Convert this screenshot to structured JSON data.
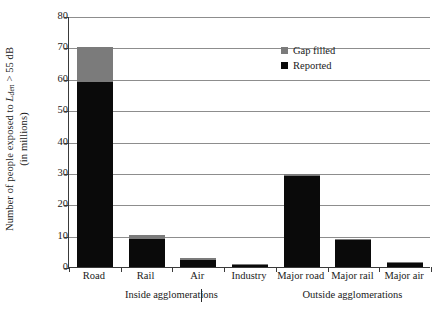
{
  "chart_data": {
    "type": "bar",
    "title": "",
    "xlabel": "",
    "ylabel_line1_prefix": "Number of people exposed to ",
    "ylabel_symbol": "L",
    "ylabel_subscript": "den",
    "ylabel_line1_suffix": " > 55 dB",
    "ylabel_line2": "(in millions)",
    "ylim": [
      0,
      80
    ],
    "ytick_values": [
      0,
      10,
      20,
      30,
      40,
      50,
      60,
      70,
      80
    ],
    "ytick_labels": [
      "0",
      "10",
      "20",
      "30",
      "40",
      "50",
      "60",
      "70",
      "80"
    ],
    "grid": true,
    "grid_axis": "y",
    "legend_position": "upper-right-inside",
    "stacked": true,
    "categories": [
      "Road",
      "Rail",
      "Air",
      "Industry",
      "Major road",
      "Major rail",
      "Major air"
    ],
    "series": [
      {
        "name": "Reported",
        "color": "#0a0a0a",
        "values": [
          59,
          9,
          2.2,
          0.9,
          29,
          8.8,
          1.3
        ]
      },
      {
        "name": "Gap filled",
        "color": "#7b7b7b",
        "values": [
          11,
          1.1,
          0.6,
          0.1,
          0.7,
          0.2,
          0.2
        ]
      }
    ],
    "totals": [
      70,
      10.1,
      2.8,
      1.0,
      29.7,
      9.0,
      1.5
    ],
    "group_labels": [
      {
        "label": "Inside agglomerations",
        "categories": [
          "Road",
          "Rail",
          "Air",
          "Industry"
        ]
      },
      {
        "label": "Outside agglomerations",
        "categories": [
          "Major road",
          "Major rail",
          "Major air"
        ]
      }
    ],
    "annotations": []
  },
  "legend": {
    "items": [
      {
        "label": "Gap filled",
        "color": "#7b7b7b"
      },
      {
        "label": "Reported",
        "color": "#0a0a0a"
      }
    ]
  }
}
